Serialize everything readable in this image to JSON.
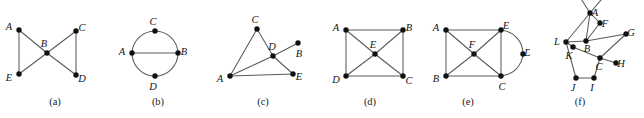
{
  "figure": {
    "width": 644,
    "height": 118,
    "background_color": "#ffffff",
    "edge_color": "#5a5a5a",
    "vertex_color": "#111111",
    "label_color": "#141414",
    "panels": [
      {
        "id": "panel-a",
        "caption": "(a)",
        "caption_x": 55,
        "caption_y": 96,
        "origin_x": 0,
        "width": 105,
        "vertices": [
          {
            "name": "A",
            "x": 19,
            "y": 30,
            "label_dx": -10,
            "label_dy": -2
          },
          {
            "name": "B",
            "x": 47,
            "y": 53,
            "label_dx": -3,
            "label_dy": -8
          },
          {
            "name": "C",
            "x": 76,
            "y": 31,
            "label_dx": 6,
            "label_dy": -2
          },
          {
            "name": "D",
            "x": 76,
            "y": 75,
            "label_dx": 6,
            "label_dy": 5
          },
          {
            "name": "E",
            "x": 19,
            "y": 74,
            "label_dx": -10,
            "label_dy": 5
          }
        ],
        "edges": [
          {
            "from": "A",
            "to": "E",
            "type": "line"
          },
          {
            "from": "C",
            "to": "D",
            "type": "line"
          },
          {
            "from": "A",
            "to": "B",
            "type": "line"
          },
          {
            "from": "E",
            "to": "B",
            "type": "line"
          },
          {
            "from": "C",
            "to": "B",
            "type": "line"
          },
          {
            "from": "D",
            "to": "B",
            "type": "line"
          }
        ]
      },
      {
        "id": "panel-b",
        "caption": "(b)",
        "caption_x": 158,
        "caption_y": 96,
        "origin_x": 105,
        "width": 105,
        "vertices": [
          {
            "name": "A",
            "x": 27,
            "y": 53,
            "label_dx": -10,
            "label_dy": 0
          },
          {
            "name": "B",
            "x": 73,
            "y": 53,
            "label_dx": 6,
            "label_dy": 0
          },
          {
            "name": "C",
            "x": 50,
            "y": 31,
            "label_dx": -2,
            "label_dy": -8
          },
          {
            "name": "D",
            "x": 50,
            "y": 76,
            "label_dx": -2,
            "label_dy": 12
          }
        ],
        "edges": [
          {
            "from": "A",
            "to": "B",
            "type": "line"
          },
          {
            "from": "A",
            "to": "C",
            "type": "arc",
            "sweep": 1,
            "radius": 23
          },
          {
            "from": "C",
            "to": "B",
            "type": "arc",
            "sweep": 1,
            "radius": 23
          },
          {
            "from": "B",
            "to": "D",
            "type": "arc",
            "sweep": 1,
            "radius": 23
          },
          {
            "from": "D",
            "to": "A",
            "type": "arc",
            "sweep": 1,
            "radius": 23
          }
        ]
      },
      {
        "id": "panel-c",
        "caption": "(c)",
        "caption_x": 263,
        "caption_y": 96,
        "origin_x": 210,
        "width": 105,
        "vertices": [
          {
            "name": "A",
            "x": 20,
            "y": 76,
            "label_dx": -10,
            "label_dy": 4
          },
          {
            "name": "B",
            "x": 88,
            "y": 43,
            "label_dx": 1,
            "label_dy": 12
          },
          {
            "name": "C",
            "x": 47,
            "y": 29,
            "label_dx": -2,
            "label_dy": -8
          },
          {
            "name": "D",
            "x": 63,
            "y": 56,
            "label_dx": -1,
            "label_dy": -8
          },
          {
            "name": "E",
            "x": 83,
            "y": 74,
            "label_dx": 6,
            "label_dy": 4
          }
        ],
        "edges": [
          {
            "from": "A",
            "to": "C",
            "type": "line"
          },
          {
            "from": "A",
            "to": "D",
            "type": "line"
          },
          {
            "from": "A",
            "to": "E",
            "type": "line"
          },
          {
            "from": "C",
            "to": "D",
            "type": "line"
          },
          {
            "from": "D",
            "to": "B",
            "type": "line"
          },
          {
            "from": "D",
            "to": "E",
            "type": "line"
          }
        ]
      },
      {
        "id": "panel-d",
        "caption": "(d)",
        "caption_x": 370,
        "caption_y": 96,
        "origin_x": 320,
        "width": 105,
        "vertices": [
          {
            "name": "A",
            "x": 26,
            "y": 30,
            "label_dx": -10,
            "label_dy": -1
          },
          {
            "name": "B",
            "x": 83,
            "y": 30,
            "label_dx": 6,
            "label_dy": -1
          },
          {
            "name": "C",
            "x": 83,
            "y": 76,
            "label_dx": 6,
            "label_dy": 6
          },
          {
            "name": "D",
            "x": 26,
            "y": 76,
            "label_dx": -10,
            "label_dy": 5
          },
          {
            "name": "E",
            "x": 55,
            "y": 54,
            "label_dx": -2,
            "label_dy": -8
          }
        ],
        "edges": [
          {
            "from": "A",
            "to": "B",
            "type": "line"
          },
          {
            "from": "A",
            "to": "D",
            "type": "line"
          },
          {
            "from": "D",
            "to": "C",
            "type": "line"
          },
          {
            "from": "B",
            "to": "C",
            "type": "line"
          },
          {
            "from": "A",
            "to": "E",
            "type": "line"
          },
          {
            "from": "B",
            "to": "E",
            "type": "line"
          },
          {
            "from": "D",
            "to": "E",
            "type": "line"
          },
          {
            "from": "C",
            "to": "E",
            "type": "line"
          }
        ]
      },
      {
        "id": "panel-e",
        "caption": "(e)",
        "caption_x": 468,
        "caption_y": 96,
        "origin_x": 425,
        "width": 105,
        "vertices": [
          {
            "name": "A",
            "x": 21,
            "y": 30,
            "label_dx": -10,
            "label_dy": -1
          },
          {
            "name": "B",
            "x": 21,
            "y": 76,
            "label_dx": -10,
            "label_dy": 4
          },
          {
            "name": "C",
            "x": 76,
            "y": 76,
            "label_dx": 1,
            "label_dy": 12
          },
          {
            "name": "D",
            "x": 98,
            "y": 54,
            "label_dx": 5,
            "label_dy": 0
          },
          {
            "name": "E",
            "x": 76,
            "y": 30,
            "label_dx": 5,
            "label_dy": -3
          },
          {
            "name": "F",
            "x": 49,
            "y": 54,
            "label_dx": -2,
            "label_dy": -8
          }
        ],
        "edges": [
          {
            "from": "A",
            "to": "E",
            "type": "line"
          },
          {
            "from": "A",
            "to": "B",
            "type": "line"
          },
          {
            "from": "B",
            "to": "C",
            "type": "line"
          },
          {
            "from": "E",
            "to": "C",
            "type": "line"
          },
          {
            "from": "A",
            "to": "F",
            "type": "line"
          },
          {
            "from": "B",
            "to": "F",
            "type": "line"
          },
          {
            "from": "C",
            "to": "F",
            "type": "line"
          },
          {
            "from": "E",
            "to": "F",
            "type": "line"
          },
          {
            "from": "E",
            "to": "D",
            "type": "arc",
            "sweep": 1,
            "radius": 24
          },
          {
            "from": "D",
            "to": "C",
            "type": "arc",
            "sweep": 1,
            "radius": 24
          }
        ]
      },
      {
        "id": "panel-f",
        "caption": "(f)",
        "caption_x": 580,
        "caption_y": 96,
        "origin_x": 530,
        "width": 114,
        "vertices": [
          {
            "name": "A",
            "x": 60,
            "y": 13,
            "label_dx": 5,
            "label_dy": 1
          },
          {
            "name": "F",
            "x": 70,
            "y": 23,
            "label_dx": 5,
            "label_dy": 2
          },
          {
            "name": "G",
            "x": 96,
            "y": 34,
            "label_dx": 5,
            "label_dy": 0
          },
          {
            "name": "L",
            "x": 36,
            "y": 42,
            "label_dx": -9,
            "label_dy": 1
          },
          {
            "name": "B",
            "x": 56,
            "y": 41,
            "label_dx": 1,
            "label_dy": 9
          },
          {
            "name": "K",
            "x": 43,
            "y": 47,
            "label_dx": -4,
            "label_dy": 10
          },
          {
            "name": "C",
            "x": 70,
            "y": 58,
            "label_dx": -1,
            "label_dy": 10
          },
          {
            "name": "H",
            "x": 86,
            "y": 63,
            "label_dx": 5,
            "label_dy": 2
          },
          {
            "name": "J",
            "x": 46,
            "y": 78,
            "label_dx": -3,
            "label_dy": 11
          },
          {
            "name": "I",
            "x": 64,
            "y": 78,
            "label_dx": -2,
            "label_dy": 11
          }
        ],
        "edges": [
          {
            "from": "A",
            "to": "F",
            "type": "line"
          },
          {
            "from": "A",
            "to": "L",
            "type": "line"
          },
          {
            "from": "A",
            "to": "B",
            "type": "line"
          },
          {
            "from": "F",
            "to": "B",
            "type": "line"
          },
          {
            "from": "L",
            "to": "B",
            "type": "line"
          },
          {
            "from": "L",
            "to": "K",
            "type": "line"
          },
          {
            "from": "B",
            "to": "G",
            "type": "line"
          },
          {
            "from": "K",
            "to": "C",
            "type": "line"
          },
          {
            "from": "G",
            "to": "C",
            "type": "line"
          },
          {
            "from": "C",
            "to": "H",
            "type": "line"
          },
          {
            "from": "C",
            "to": "I",
            "type": "line"
          },
          {
            "from": "J",
            "to": "I",
            "type": "line"
          },
          {
            "from": "L",
            "to": "J",
            "type": "line"
          }
        ],
        "open_edges": [
          {
            "from": "A",
            "to_x": 48,
            "to_y": -6
          },
          {
            "from": "A",
            "to_x": 76,
            "to_y": -6
          }
        ]
      }
    ]
  }
}
